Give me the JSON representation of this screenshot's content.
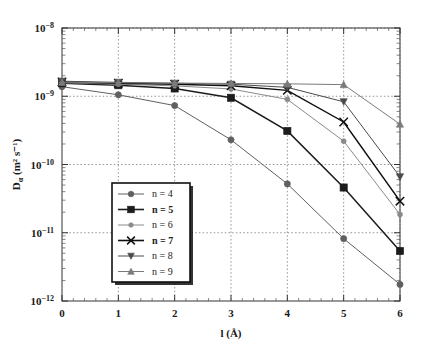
{
  "figure": {
    "background": "#ffffff",
    "frame_color": "#555555",
    "grid_color": "#888888"
  },
  "chart_data": {
    "type": "line",
    "title": "",
    "xlabel": "l (Å)",
    "ylabel": "Dα (m² s⁻¹)",
    "ylabel_parts": {
      "main": "D",
      "sub": "α",
      "unit": "(m² s⁻¹)"
    },
    "xscale": "linear",
    "yscale": "log",
    "xlim": [
      0,
      6
    ],
    "ylim": [
      1e-12,
      1e-08
    ],
    "grid": true,
    "grid_style": "dotted",
    "legend_position": "lower-left-inside",
    "x": [
      0,
      1,
      2,
      3,
      4,
      5,
      6
    ],
    "xticks": [
      "0",
      "1",
      "2",
      "3",
      "4",
      "5",
      "6"
    ],
    "yticks": [
      "10⁻¹²",
      "10⁻¹¹",
      "10⁻¹⁰",
      "10⁻⁹",
      "10⁻⁸"
    ],
    "ytick_exponents": [
      -12,
      -11,
      -10,
      -9,
      -8
    ],
    "series": [
      {
        "name": "n = 4",
        "label": "n = 4",
        "marker": "circle",
        "color": "#606060",
        "bold": false,
        "values": [
          1.38e-09,
          1.05e-09,
          7.3e-10,
          2.3e-10,
          5.2e-11,
          8.2e-12,
          1.75e-12
        ]
      },
      {
        "name": "n = 5",
        "label": "n = 5",
        "marker": "square",
        "color": "#1c1c1c",
        "bold": true,
        "values": [
          1.55e-09,
          1.45e-09,
          1.3e-09,
          9.5e-10,
          3.1e-10,
          4.6e-11,
          5.4e-12
        ]
      },
      {
        "name": "n = 6",
        "label": "n = 6",
        "marker": "smallcircle",
        "color": "#8a8a8a",
        "bold": false,
        "values": [
          1.58e-09,
          1.5e-09,
          1.42e-09,
          1.28e-09,
          9e-10,
          2.2e-10,
          1.85e-11
        ]
      },
      {
        "name": "n = 7",
        "label": "n = 7",
        "marker": "cross",
        "color": "#101010",
        "bold": true,
        "values": [
          1.62e-09,
          1.55e-09,
          1.5e-09,
          1.42e-09,
          1.22e-09,
          4.2e-10,
          2.9e-11
        ]
      },
      {
        "name": "n = 8",
        "label": "n = 8",
        "marker": "triangle-down",
        "color": "#4a4a4a",
        "bold": false,
        "values": [
          1.66e-09,
          1.6e-09,
          1.55e-09,
          1.5e-09,
          1.35e-09,
          8.3e-10,
          6.6e-11
        ]
      },
      {
        "name": "n = 9",
        "label": "n = 9",
        "marker": "triangle-up",
        "color": "#7b7b7b",
        "bold": false,
        "values": [
          1.6e-09,
          1.58e-09,
          1.56e-09,
          1.54e-09,
          1.52e-09,
          1.48e-09,
          3.9e-10
        ]
      }
    ]
  }
}
